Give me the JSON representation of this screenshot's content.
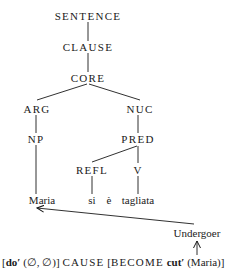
{
  "diagram": {
    "type": "syntax-tree",
    "framework": "Role and Reference Grammar layered structure",
    "nodes": {
      "sentence": "SENTENCE",
      "clause": "CLAUSE",
      "core": "CORE",
      "arg": "ARG",
      "nuc": "NUC",
      "np": "NP",
      "pred": "PRED",
      "refl": "REFL",
      "v": "V"
    },
    "words": {
      "maria": "Maria",
      "si": "si",
      "e": "è",
      "tagliata": "tagliata"
    },
    "edges": [
      [
        "SENTENCE",
        "CLAUSE"
      ],
      [
        "CLAUSE",
        "CORE"
      ],
      [
        "CORE",
        "ARG"
      ],
      [
        "CORE",
        "NUC"
      ],
      [
        "ARG",
        "NP"
      ],
      [
        "NUC",
        "PRED"
      ],
      [
        "PRED",
        "REFL"
      ],
      [
        "PRED",
        "V"
      ],
      [
        "NP",
        "Maria"
      ],
      [
        "REFL",
        "si"
      ],
      [
        "V",
        "tagliata"
      ]
    ],
    "macrorole_label": "Undergoer",
    "arrows": [
      {
        "from": "cut'(Maria) argument",
        "to": "Undergoer"
      },
      {
        "from": "Undergoer",
        "to": "Maria"
      }
    ],
    "logical_structure": {
      "part1_open": "[",
      "do_pred": "do′",
      "do_args": " (∅, ∅)] ",
      "cause": "CAUSE",
      "bracket2": " [",
      "become": "BECOME",
      "space": " ",
      "cut_pred": "cut′",
      "cut_args": " (Maria)]"
    }
  }
}
